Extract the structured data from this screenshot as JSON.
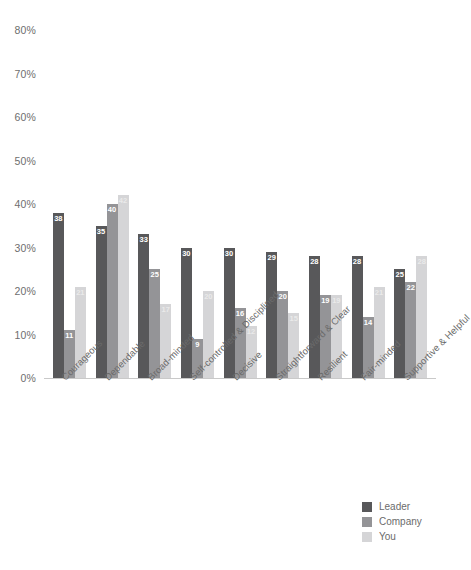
{
  "chart_data": {
    "type": "bar",
    "title": "",
    "subtitle": "",
    "xlabel": "",
    "ylabel": "",
    "ylim": [
      0,
      80
    ],
    "ytick_step": 10,
    "grid": false,
    "legend_position": "bottom-right",
    "value_suffix": "%",
    "yticks": [
      "80%",
      "70%",
      "60%",
      "50%",
      "40%",
      "30%",
      "20%",
      "10%",
      "0%"
    ],
    "ytick_values": [
      80,
      70,
      60,
      50,
      40,
      30,
      20,
      10,
      0
    ],
    "categories": [
      "Courageous",
      "Dependable",
      "Broad-minded",
      "Self-controlled & Disciplined",
      "Decisive",
      "Straightforward & Clear",
      "Resilient",
      "Fair-minded",
      "Supportive & Helpful"
    ],
    "series": [
      {
        "name": "Leader",
        "color": "#58585a",
        "values": [
          38,
          35,
          33,
          30,
          30,
          29,
          28,
          28,
          25
        ]
      },
      {
        "name": "Company",
        "color": "#949497",
        "values": [
          11,
          40,
          25,
          9,
          16,
          20,
          19,
          14,
          22
        ]
      },
      {
        "name": "You",
        "color": "#d5d5d7",
        "values": [
          21,
          42,
          17,
          20,
          12,
          15,
          19,
          21,
          28
        ]
      }
    ]
  },
  "legend": {
    "items": [
      {
        "label": "Leader",
        "color": "#58585a"
      },
      {
        "label": "Company",
        "color": "#949497"
      },
      {
        "label": "You",
        "color": "#d5d5d7"
      }
    ]
  }
}
